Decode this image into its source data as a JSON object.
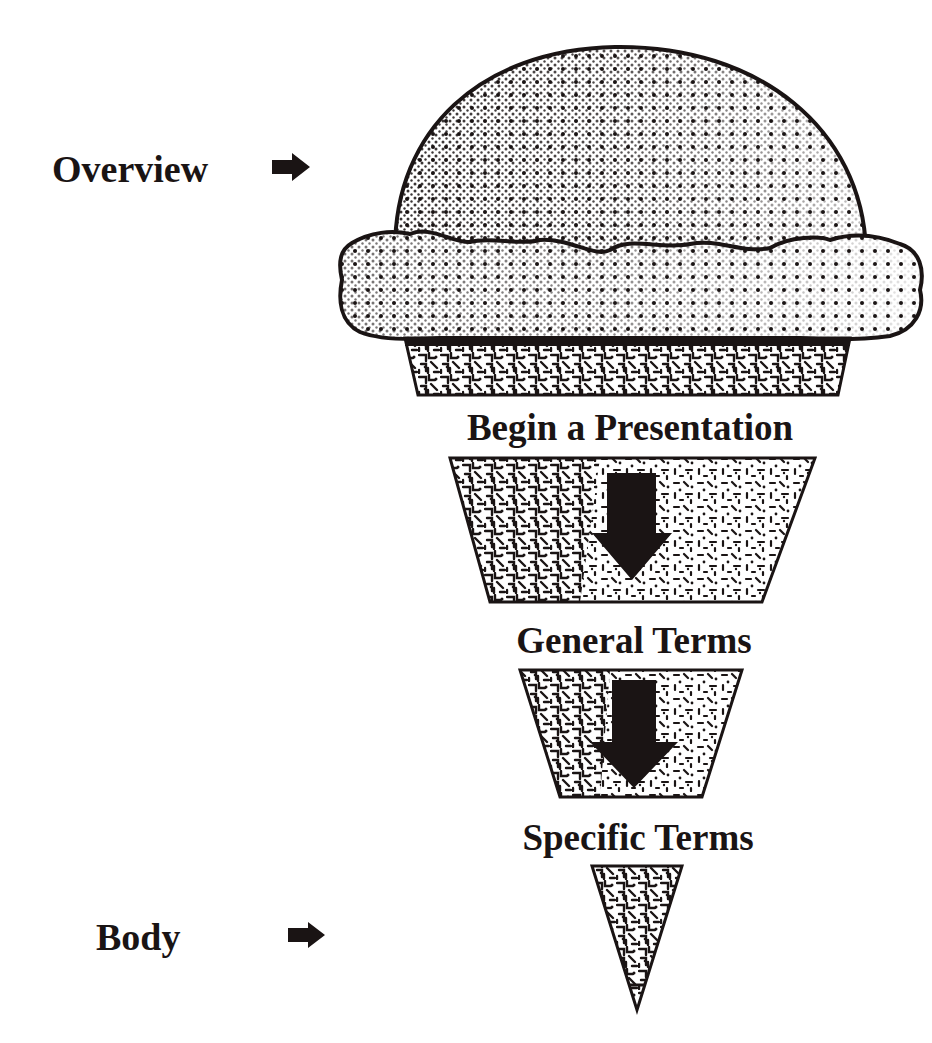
{
  "diagram": {
    "type": "ice-cream-cone presentation structure",
    "colors": {
      "ink": "#1a1414",
      "background": "#ffffff"
    },
    "side_labels": [
      {
        "text": "Overview",
        "points_to": "ice-cream-scoop",
        "icon": "right-arrow-icon"
      },
      {
        "text": "Body",
        "points_to": "cone-tip",
        "icon": "right-arrow-icon"
      }
    ],
    "stages": [
      {
        "text": "Begin a Presentation"
      },
      {
        "text": "General Terms"
      },
      {
        "text": "Specific Terms"
      }
    ],
    "flow_arrows": [
      {
        "from": "Begin a Presentation",
        "to": "General Terms",
        "icon": "down-arrow-icon"
      },
      {
        "from": "General Terms",
        "to": "Specific Terms",
        "icon": "down-arrow-icon"
      }
    ]
  }
}
